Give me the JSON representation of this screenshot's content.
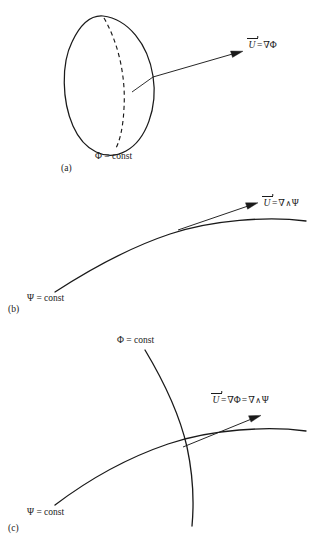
{
  "figure": {
    "background_color": "#ffffff",
    "line_color": "#1a1a1a",
    "text_color": "#1a1a1a"
  },
  "panels": [
    {
      "id": "a",
      "label": "(a)",
      "surface_label": "Φ = const",
      "equation": {
        "vector": "U",
        "equals": "=",
        "rhs_grad": "∇Φ"
      },
      "equation_plain": "U = ∇Φ",
      "shape": "equipotential-surface-ellipse",
      "has_dashed_meridian": true
    },
    {
      "id": "b",
      "label": "(b)",
      "curve_label": "Ψ = const",
      "equation": {
        "vector": "U",
        "equals": "=",
        "rhs_grad": "∇",
        "wedge": "∧",
        "rhs_psi": "Ψ"
      },
      "equation_plain": "U = ∇∧Ψ",
      "shape": "streamline-curve"
    },
    {
      "id": "c",
      "label": "(c)",
      "phi_label": "Φ = const",
      "psi_label": "Ψ = const",
      "equation": {
        "vector": "U",
        "equals1": "=",
        "rhs_grad_phi": "∇Φ",
        "equals2": "=",
        "rhs_grad": "∇",
        "wedge": "∧",
        "rhs_psi": "Ψ"
      },
      "equation_plain": "U = ∇Φ = ∇∧Ψ",
      "shape": "orthogonal-curves-crossing"
    }
  ]
}
